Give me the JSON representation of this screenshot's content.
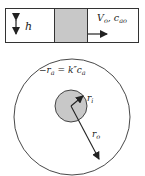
{
  "top_panel": {
    "height_label": "h",
    "flow_label_main": "V",
    "flow_label_sub1": "o",
    "flow_label_sep": ", c",
    "flow_label_sub2": "ao"
  },
  "circle_panel": {
    "rate_lhs": "−r",
    "rate_lhs_sub": "a",
    "rate_eq": " = k″c",
    "rate_rhs_sub": "a",
    "inner_radius_label": "r",
    "inner_radius_sub": "i",
    "outer_radius_label": "r",
    "outer_radius_sub": "o"
  },
  "colors": {
    "stroke": "#333333",
    "fill_gray": "#c8c8c8"
  }
}
